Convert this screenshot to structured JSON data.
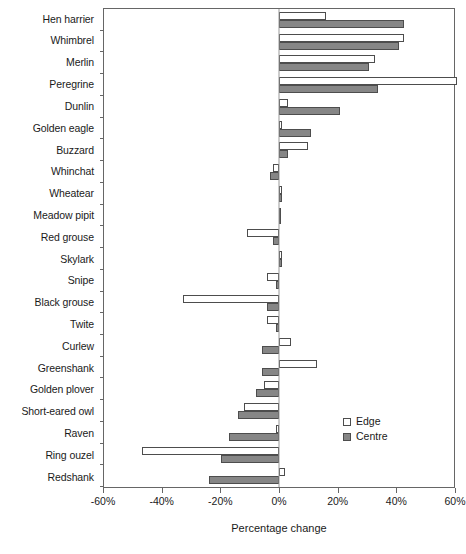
{
  "chart_data": {
    "type": "bar",
    "orientation": "horizontal",
    "title": "",
    "xlabel": "Percentage change",
    "ylabel": "",
    "xlim": [
      -60,
      60
    ],
    "xticks": [
      -60,
      -40,
      -20,
      0,
      20,
      40,
      60
    ],
    "xticklabels": [
      "-60%",
      "-40%",
      "-20%",
      "0%",
      "20%",
      "40%",
      "60%"
    ],
    "grid": false,
    "legend_position": "lower-right",
    "categories": [
      "Hen harrier",
      "Whimbrel",
      "Merlin",
      "Peregrine",
      "Dunlin",
      "Golden eagle",
      "Buzzard",
      "Whinchat",
      "Wheatear",
      "Meadow pipit",
      "Red grouse",
      "Skylark",
      "Snipe",
      "Black grouse",
      "Twite",
      "Curlew",
      "Greenshank",
      "Golden plover",
      "Short-eared owl",
      "Raven",
      "Ring ouzel",
      "Redshank"
    ],
    "series": [
      {
        "name": "Edge",
        "color": "#ffffff",
        "values": [
          16,
          43,
          33,
          61,
          3,
          1,
          10,
          -2,
          1,
          0,
          -11,
          1,
          -4,
          -33,
          -4,
          4,
          13,
          -5,
          -12,
          -1,
          -47,
          2
        ]
      },
      {
        "name": "Centre",
        "color": "#868686",
        "values": [
          43,
          41,
          31,
          34,
          21,
          11,
          3,
          -3,
          1,
          0,
          -2,
          1,
          -1,
          -4,
          -1,
          -6,
          -6,
          -8,
          -14,
          -17,
          -20,
          -24
        ]
      }
    ]
  },
  "legend": {
    "items": [
      {
        "label": "Edge",
        "swatch": "edge"
      },
      {
        "label": "Centre",
        "swatch": "centre"
      }
    ]
  }
}
